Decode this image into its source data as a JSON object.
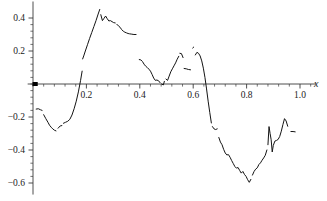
{
  "chart_data": {
    "type": "line",
    "title": "",
    "subtitle": "",
    "xlabel": "x",
    "ylabel": "",
    "xlim": [
      -0.02,
      1.06
    ],
    "ylim": [
      -0.67,
      0.5
    ],
    "grid": false,
    "legend": null,
    "x_ticks": [
      0.2,
      0.4,
      0.6,
      0.8,
      1.0
    ],
    "x_tick_labels": [
      "0.2",
      "0.4",
      "0.6",
      "0.8",
      "1.0"
    ],
    "x_minor_tick_count": 4,
    "y_ticks": [
      0.4,
      0.2,
      -0.2,
      -0.4,
      -0.6
    ],
    "y_tick_labels": [
      "0.4",
      "0.2",
      "-0.2",
      "-0.4",
      "-0.6"
    ],
    "y_minor_tick_count": 4,
    "axis_color": "#3a3a3a",
    "series_color": "#141414",
    "markers": [
      {
        "name": "origin-marker",
        "x": 0.008,
        "y": 0.0
      }
    ],
    "series": [
      {
        "name": "signal",
        "style": "fragmented-line",
        "segments": [
          {
            "name": "segment-1",
            "x": [
              0.012,
              0.02,
              0.028,
              0.034
            ],
            "y": [
              -0.152,
              -0.15,
              -0.156,
              -0.16
            ]
          },
          {
            "name": "segment-2",
            "x": [
              0.04,
              0.048,
              0.056,
              0.062,
              0.068,
              0.074,
              0.08,
              0.086
            ],
            "y": [
              -0.186,
              -0.21,
              -0.232,
              -0.25,
              -0.262,
              -0.272,
              -0.28,
              -0.284
            ]
          },
          {
            "name": "segment-3",
            "x": [
              0.094,
              0.102,
              0.108
            ],
            "y": [
              -0.268,
              -0.254,
              -0.252
            ]
          },
          {
            "name": "segment-4",
            "x": [
              0.114,
              0.122,
              0.13,
              0.138,
              0.146,
              0.154,
              0.162,
              0.17,
              0.178,
              0.184
            ],
            "y": [
              -0.238,
              -0.232,
              -0.226,
              -0.214,
              -0.188,
              -0.15,
              -0.104,
              -0.048,
              0.02,
              0.078
            ]
          },
          {
            "name": "segment-5",
            "x": [
              0.186,
              0.19,
              0.196,
              0.204,
              0.212,
              0.22,
              0.228,
              0.236,
              0.244,
              0.25
            ],
            "y": [
              0.152,
              0.17,
              0.2,
              0.238,
              0.276,
              0.312,
              0.348,
              0.384,
              0.424,
              0.452
            ]
          },
          {
            "name": "segment-6",
            "x": [
              0.254,
              0.26,
              0.266,
              0.272,
              0.278,
              0.284,
              0.29,
              0.296,
              0.302,
              0.308
            ],
            "y": [
              0.42,
              0.384,
              0.398,
              0.412,
              0.396,
              0.382,
              0.384,
              0.378,
              0.372,
              0.37
            ]
          },
          {
            "name": "segment-7",
            "x": [
              0.314,
              0.32,
              0.326,
              0.332,
              0.338,
              0.344,
              0.35,
              0.356,
              0.362,
              0.37,
              0.378,
              0.386
            ],
            "y": [
              0.362,
              0.352,
              0.344,
              0.33,
              0.32,
              0.314,
              0.31,
              0.306,
              0.304,
              0.302,
              0.3,
              0.3
            ]
          },
          {
            "name": "segment-8",
            "x": [
              0.398,
              0.404,
              0.41,
              0.416,
              0.422,
              0.428,
              0.434,
              0.44,
              0.446,
              0.452,
              0.458,
              0.464,
              0.47,
              0.476
            ],
            "y": [
              0.148,
              0.146,
              0.136,
              0.12,
              0.108,
              0.1,
              0.09,
              0.078,
              0.058,
              0.036,
              0.022,
              0.024,
              0.02,
              0.008
            ]
          },
          {
            "name": "segment-9",
            "x": [
              0.482,
              0.488,
              0.492
            ],
            "y": [
              0.0,
              -0.006,
              0.016
            ]
          },
          {
            "name": "segment-10",
            "x": [
              0.498,
              0.504,
              0.51,
              0.516,
              0.522,
              0.528,
              0.534,
              0.54,
              0.546
            ],
            "y": [
              0.03,
              0.022,
              0.048,
              0.074,
              0.092,
              0.11,
              0.128,
              0.15,
              0.168
            ]
          },
          {
            "name": "segment-11",
            "x": [
              0.55,
              0.556,
              0.562
            ],
            "y": [
              0.186,
              0.184,
              0.16
            ]
          },
          {
            "name": "segment-12",
            "x": [
              0.566,
              0.574,
              0.582,
              0.59
            ],
            "y": [
              0.094,
              0.092,
              0.088,
              0.086
            ]
          },
          {
            "name": "segment-13",
            "x": [
              0.598,
              0.602
            ],
            "y": [
              0.218,
              0.224
            ]
          },
          {
            "name": "segment-14",
            "x": [
              0.608,
              0.614,
              0.62,
              0.626,
              0.632,
              0.638,
              0.644,
              0.65,
              0.656,
              0.662,
              0.668
            ],
            "y": [
              0.176,
              0.192,
              0.186,
              0.17,
              0.14,
              0.096,
              0.04,
              -0.03,
              -0.104,
              -0.172,
              -0.236
            ]
          },
          {
            "name": "segment-15",
            "x": [
              0.672,
              0.678,
              0.684,
              0.69
            ],
            "y": [
              -0.258,
              -0.272,
              -0.276,
              -0.272
            ]
          },
          {
            "name": "segment-16",
            "x": [
              0.696,
              0.702,
              0.708,
              0.714,
              0.72,
              0.726,
              0.732,
              0.738,
              0.744,
              0.75,
              0.756,
              0.762,
              0.768,
              0.774,
              0.78,
              0.786,
              0.792,
              0.798,
              0.804,
              0.81,
              0.816
            ],
            "y": [
              -0.324,
              -0.352,
              -0.368,
              -0.396,
              -0.418,
              -0.43,
              -0.428,
              -0.444,
              -0.464,
              -0.482,
              -0.5,
              -0.51,
              -0.506,
              -0.524,
              -0.54,
              -0.53,
              -0.548,
              -0.56,
              -0.58,
              -0.596,
              -0.578
            ]
          },
          {
            "name": "segment-17",
            "x": [
              0.822,
              0.828,
              0.834,
              0.84,
              0.846,
              0.852,
              0.858,
              0.864,
              0.87,
              0.876
            ],
            "y": [
              -0.552,
              -0.53,
              -0.516,
              -0.508,
              -0.488,
              -0.478,
              -0.462,
              -0.448,
              -0.432,
              -0.4
            ]
          },
          {
            "name": "segment-18",
            "x": [
              0.88,
              0.884,
              0.888,
              0.892,
              0.896,
              0.9,
              0.906,
              0.912,
              0.918,
              0.924,
              0.93,
              0.936,
              0.942,
              0.948,
              0.954
            ],
            "y": [
              -0.368,
              -0.258,
              -0.3,
              -0.338,
              -0.412,
              -0.372,
              -0.346,
              -0.342,
              -0.336,
              -0.318,
              -0.286,
              -0.246,
              -0.21,
              -0.224,
              -0.256
            ]
          },
          {
            "name": "segment-19",
            "x": [
              0.966,
              0.974,
              0.982
            ],
            "y": [
              -0.288,
              -0.288,
              -0.29
            ]
          }
        ]
      }
    ]
  }
}
